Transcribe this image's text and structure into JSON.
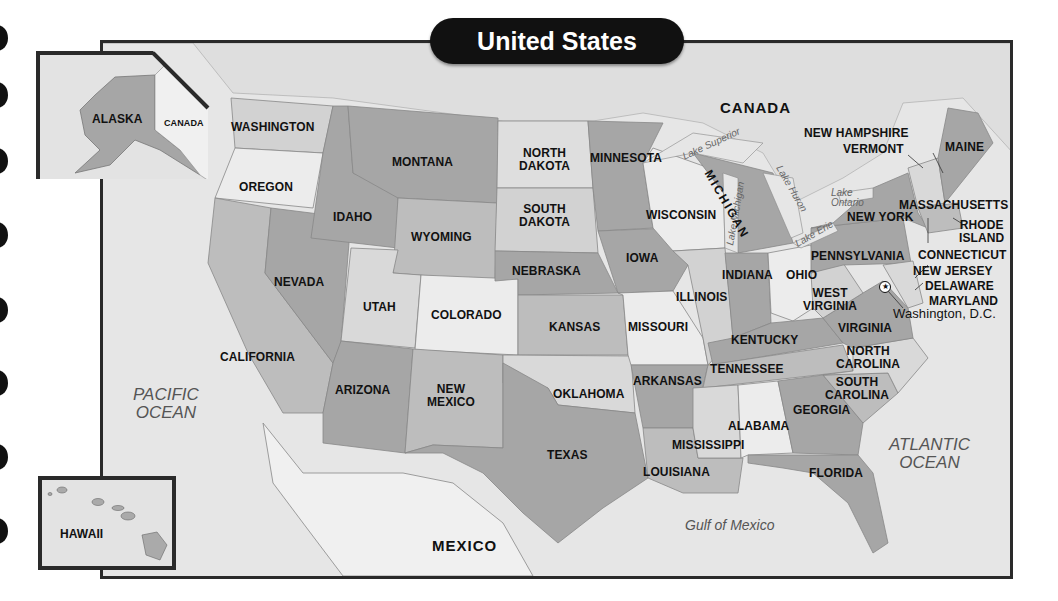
{
  "title": "United States",
  "colors": {
    "water": "#e6e6e6",
    "state_dark": "#a6a6a6",
    "state_mid": "#bdbdbd",
    "state_light": "#d9d9d9",
    "state_white": "#ececec",
    "frame": "#2a2a2a",
    "title_bg": "#111111",
    "title_text": "#ffffff"
  },
  "countries": {
    "canada": "CANADA",
    "mexico": "MEXICO",
    "alaska_canada": "CANADA"
  },
  "oceans": {
    "pacific_line1": "PACIFIC",
    "pacific_line2": "OCEAN",
    "atlantic_line1": "ATLANTIC",
    "atlantic_line2": "OCEAN",
    "gulf": "Gulf of Mexico"
  },
  "lakes": {
    "superior": "Lake Superior",
    "michigan": "Lake Michigan",
    "huron": "Lake Huron",
    "erie": "Lake Erie",
    "ontario_line1": "Lake",
    "ontario_line2": "Ontario"
  },
  "insets": {
    "alaska": "ALASKA",
    "hawaii": "HAWAII"
  },
  "capital": {
    "label": "Washington, D.C.",
    "icon": "star-in-circle-icon"
  },
  "states": {
    "washington": "WASHINGTON",
    "oregon": "OREGON",
    "california": "CALIFORNIA",
    "idaho": "IDAHO",
    "nevada": "NEVADA",
    "montana": "MONTANA",
    "wyoming": "WYOMING",
    "utah": "UTAH",
    "colorado": "COLORADO",
    "arizona": "ARIZONA",
    "new_mexico_1": "NEW",
    "new_mexico_2": "MEXICO",
    "north_dakota_1": "NORTH",
    "north_dakota_2": "DAKOTA",
    "south_dakota_1": "SOUTH",
    "south_dakota_2": "DAKOTA",
    "nebraska": "NEBRASKA",
    "kansas": "KANSAS",
    "oklahoma": "OKLAHOMA",
    "texas": "TEXAS",
    "minnesota": "MINNESOTA",
    "iowa": "IOWA",
    "missouri": "MISSOURI",
    "arkansas": "ARKANSAS",
    "louisiana": "LOUISIANA",
    "wisconsin": "WISCONSIN",
    "illinois": "ILLINOIS",
    "michigan": "MICHIGAN",
    "indiana": "INDIANA",
    "ohio": "OHIO",
    "kentucky": "KENTUCKY",
    "tennessee": "TENNESSEE",
    "mississippi": "MISSISSIPPI",
    "alabama": "ALABAMA",
    "georgia": "GEORGIA",
    "florida": "FLORIDA",
    "south_carolina_1": "SOUTH",
    "south_carolina_2": "CAROLINA",
    "north_carolina_1": "NORTH",
    "north_carolina_2": "CAROLINA",
    "virginia": "VIRGINIA",
    "west_virginia_1": "WEST",
    "west_virginia_2": "VIRGINIA",
    "pennsylvania": "PENNSYLVANIA",
    "new_york": "NEW YORK",
    "vermont": "VERMONT",
    "new_hampshire": "NEW HAMPSHIRE",
    "maine": "MAINE",
    "massachusetts": "MASSACHUSETTS",
    "rhode_island_1": "RHODE",
    "rhode_island_2": "ISLAND",
    "connecticut": "CONNECTICUT",
    "new_jersey": "NEW JERSEY",
    "delaware": "DELAWARE",
    "maryland": "MARYLAND"
  }
}
